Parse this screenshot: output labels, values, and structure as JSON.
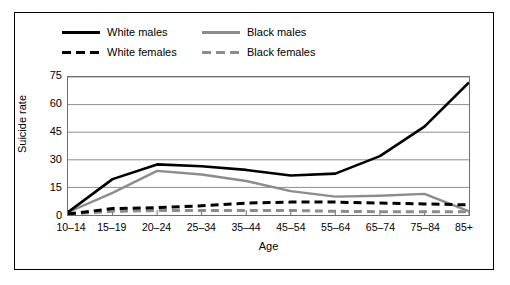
{
  "chart_data": {
    "type": "line",
    "title": "",
    "xlabel": "Age",
    "ylabel": "Suicide rate",
    "categories": [
      "10–14",
      "15–19",
      "20–24",
      "25–34",
      "35–44",
      "45–54",
      "55–64",
      "65–74",
      "75–84",
      "85+"
    ],
    "yticks": [
      0,
      15,
      30,
      45,
      60,
      75
    ],
    "ylim": [
      0,
      75
    ],
    "grid": true,
    "legend_position": "top-left",
    "series": [
      {
        "name": "White males",
        "color": "#000000",
        "style": "solid",
        "values": [
          1.5,
          19.5,
          27.5,
          26.5,
          24.5,
          21.5,
          22.5,
          32.0,
          48.0,
          72.0
        ]
      },
      {
        "name": "Black males",
        "color": "#8c8c8c",
        "style": "solid",
        "values": [
          1.5,
          12.0,
          24.0,
          22.0,
          18.5,
          13.0,
          10.0,
          10.5,
          11.5,
          2.0
        ]
      },
      {
        "name": "White females",
        "color": "#000000",
        "style": "dashed",
        "values": [
          0.5,
          3.5,
          4.0,
          5.0,
          6.5,
          7.0,
          7.0,
          6.5,
          6.0,
          5.5
        ]
      },
      {
        "name": "Black females",
        "color": "#8c8c8c",
        "style": "dashed",
        "values": [
          0.5,
          2.0,
          2.5,
          2.5,
          2.5,
          2.5,
          2.0,
          1.8,
          1.8,
          1.8
        ]
      }
    ]
  },
  "legend": {
    "items": [
      {
        "label": "White males",
        "swatch": "solid-black"
      },
      {
        "label": "Black males",
        "swatch": "solid-gray"
      },
      {
        "label": "White females",
        "swatch": "dashed-black"
      },
      {
        "label": "Black females",
        "swatch": "dashed-gray"
      }
    ]
  }
}
